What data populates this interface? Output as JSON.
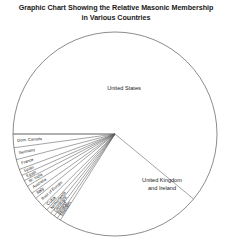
{
  "title": {
    "line1": "Graphic Chart Showing the Relative Masonic Membership",
    "line2": "in Various Countries"
  },
  "colors": {
    "stroke": "#555555",
    "text": "#1a1a1a",
    "background": "#ffffff"
  },
  "labels": {
    "united_states": "United States",
    "united_kingdom_line1": "United Kingdom",
    "united_kingdom_line2": "and Ireland"
  },
  "chart_data": {
    "type": "pie",
    "title": "Graphic Chart Showing the Relative Masonic Membership in Various Countries",
    "xlabel": "",
    "ylabel": "",
    "legend": "none",
    "grid": false,
    "units": "share of total Masonic membership (percent)",
    "start_angle_deg": 180,
    "direction": "clockwise",
    "categories": [
      "United States",
      "United Kingdom and Ireland",
      "Sweden",
      "Ireland",
      "Denmark",
      "Netherlands",
      "Cuba",
      "Rest of Europe",
      "Italy",
      "Australia",
      "Br. India",
      "Egypt",
      "Spain",
      "France",
      "Germany",
      "Dom. Canada"
    ],
    "values": [
      61.0,
      23.0,
      0.55,
      0.6,
      0.7,
      0.8,
      0.9,
      1.6,
      1.0,
      1.3,
      1.0,
      0.9,
      1.0,
      1.6,
      1.9,
      2.15
    ],
    "slices": [
      {
        "label": "United States",
        "value": 61.0,
        "label_placement": "inside",
        "label_rotation_deg": 0
      },
      {
        "label": "United Kingdom and Ireland",
        "value": 23.0,
        "label_placement": "inside",
        "label_rotation_deg": 0
      },
      {
        "label": "Sweden",
        "value": 0.55,
        "label_placement": "radial",
        "label_rotation_deg": 78
      },
      {
        "label": "Ireland",
        "value": 0.6,
        "label_placement": "radial",
        "label_rotation_deg": 73
      },
      {
        "label": "Denmark",
        "value": 0.7,
        "label_placement": "radial",
        "label_rotation_deg": 68
      },
      {
        "label": "Netherlands",
        "value": 0.8,
        "label_placement": "radial",
        "label_rotation_deg": 63
      },
      {
        "label": "Cuba",
        "value": 0.9,
        "label_placement": "radial",
        "label_rotation_deg": 58
      },
      {
        "label": "Rest of Europe",
        "value": 1.6,
        "label_placement": "radial",
        "label_rotation_deg": 52
      },
      {
        "label": "Italy",
        "value": 1.0,
        "label_placement": "radial",
        "label_rotation_deg": 45
      },
      {
        "label": "Australia",
        "value": 1.3,
        "label_placement": "radial",
        "label_rotation_deg": 39
      },
      {
        "label": "Br. India",
        "value": 1.0,
        "label_placement": "radial",
        "label_rotation_deg": 33
      },
      {
        "label": "Egypt",
        "value": 0.9,
        "label_placement": "radial",
        "label_rotation_deg": 28
      },
      {
        "label": "Spain",
        "value": 1.0,
        "label_placement": "radial",
        "label_rotation_deg": 23
      },
      {
        "label": "France",
        "value": 1.6,
        "label_placement": "radial",
        "label_rotation_deg": 17
      },
      {
        "label": "Germany",
        "value": 1.9,
        "label_placement": "radial",
        "label_rotation_deg": 10
      },
      {
        "label": "Dom. Canada",
        "value": 2.15,
        "label_placement": "radial",
        "label_rotation_deg": 3
      }
    ]
  },
  "fan_labels": [
    "Dom. Canada",
    "Germany",
    "France",
    "Spain",
    "Egypt",
    "Br. India",
    "Australia",
    "Italy",
    "Rest of Europe",
    "Cuba",
    "Netherlands",
    "Denmark",
    "Ireland",
    "Sweden"
  ]
}
